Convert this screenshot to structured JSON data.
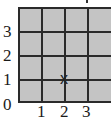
{
  "grid": {
    "columns": 4,
    "rows": 4,
    "fill_color": "#c4c4c4",
    "line_color": "#2a2a2a"
  },
  "axes": {
    "y_labels": [
      "0",
      "1",
      "2",
      "3"
    ],
    "x_labels": [
      "1",
      "2",
      "3"
    ]
  },
  "marker": {
    "label": "x",
    "x": 2,
    "y": 1
  }
}
